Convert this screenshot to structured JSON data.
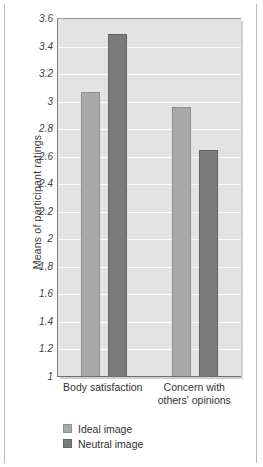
{
  "chart_data": {
    "type": "bar",
    "title": "",
    "xlabel": "",
    "ylabel": "Means of participant ratings",
    "ylim": [
      1,
      3.6
    ],
    "ytick_step": 0.2,
    "yticks": [
      "3.6",
      "3.4",
      "3.2",
      "3",
      "2.8",
      "2.6",
      "2.4",
      "2.2",
      "2",
      "1.8",
      "1.6",
      "1.4",
      "1.2",
      "1"
    ],
    "ytick_values": [
      3.6,
      3.4,
      3.2,
      3,
      2.8,
      2.6,
      2.4,
      2.2,
      2,
      1.8,
      1.6,
      1.4,
      1.2,
      1
    ],
    "categories": [
      "Body satisfaction",
      "Concern with\nothers' opinions"
    ],
    "series": [
      {
        "name": "Ideal image",
        "color": "#a9a9a9",
        "values": [
          3.07,
          2.96
        ]
      },
      {
        "name": "Neutral image",
        "color": "#7b7b7b",
        "values": [
          3.49,
          2.65
        ]
      }
    ],
    "grid": true,
    "grid_color": "#fbfbfb",
    "plot_background": "#e3e3e3",
    "legend_position": "bottom-left",
    "legend": [
      "Ideal image",
      "Neutral image"
    ]
  }
}
